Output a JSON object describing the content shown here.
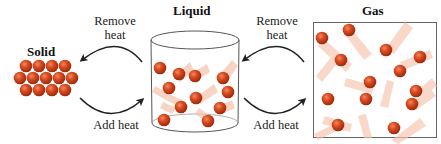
{
  "diagram": {
    "states": [
      {
        "name": "Solid",
        "arrangement": "close-packed lattice",
        "particle_rows": [
          4,
          5,
          4
        ]
      },
      {
        "name": "Liquid",
        "container": "open cylinder",
        "particle_count": 12
      },
      {
        "name": "Gas",
        "container": "box",
        "particle_count": 15
      }
    ],
    "transitions": [
      {
        "from": "Liquid",
        "to": "Solid",
        "label_line1": "Remove",
        "label_line2": "heat"
      },
      {
        "from": "Solid",
        "to": "Liquid",
        "label": "Add heat"
      },
      {
        "from": "Gas",
        "to": "Liquid",
        "label_line1": "Remove",
        "label_line2": "heat"
      },
      {
        "from": "Liquid",
        "to": "Gas",
        "label": "Add heat"
      }
    ],
    "colors": {
      "particle": "#d4471f",
      "particle_dark": "#a8300f",
      "particle_highlight": "#f08060",
      "trail": "#f4b8a0",
      "outline": "#555555",
      "arrow": "#222222"
    }
  }
}
